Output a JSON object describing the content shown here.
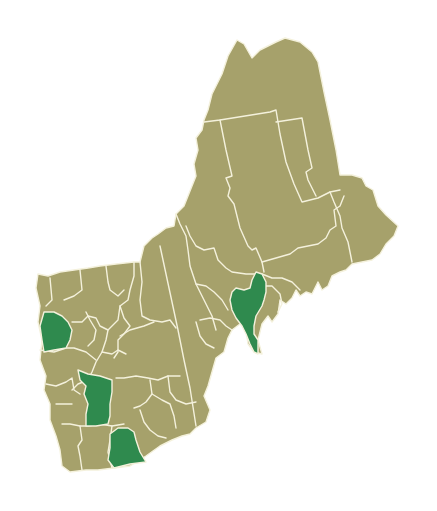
{
  "map": {
    "title": "",
    "region": "Northern New England counties",
    "colors": {
      "base": "#a6a16b",
      "highlight": "#2f8a4e",
      "border": "#f4f1dc",
      "background": "#ffffff"
    },
    "legend": [],
    "highlighted_counties": [
      {
        "id": "vt-west",
        "label": "",
        "approx_center": [
          57,
          330
        ]
      },
      {
        "id": "nh-central-west",
        "label": "",
        "approx_center": [
          96,
          398
        ]
      },
      {
        "id": "nh-south",
        "label": "",
        "approx_center": [
          125,
          447
        ]
      },
      {
        "id": "me-central-coast",
        "label": "",
        "approx_center": [
          244,
          308
        ]
      }
    ]
  }
}
